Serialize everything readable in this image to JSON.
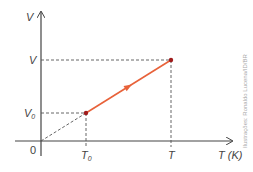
{
  "diagram": {
    "type": "V-T graph (isobaric process)",
    "y_axis": {
      "label": "V"
    },
    "x_axis": {
      "label": "T (K)"
    },
    "origin_label": "0",
    "points": [
      {
        "name": "initial",
        "v_label": "V",
        "v_sub": "0",
        "t_label": "T",
        "t_sub": "0"
      },
      {
        "name": "final",
        "v_label": "V",
        "t_label": "T"
      }
    ],
    "line_color": "#e8623a",
    "point_color": "#a01c1c",
    "axis_color": "#444444",
    "credit": "Ilustrações: Ronaldo Lucena/ID/BR"
  }
}
